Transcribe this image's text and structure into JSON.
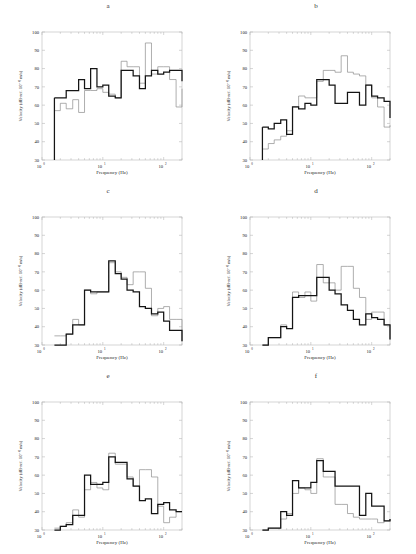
{
  "figure": {
    "panel_count": 6,
    "rows": 3,
    "cols": 2
  },
  "axes": {
    "ylabel": "Velocity (dB-ref. 10⁻⁹ m/s)",
    "xlabel": "Frequency (Hz)",
    "ylim": [
      30,
      100
    ],
    "yticks": [
      30,
      40,
      50,
      60,
      70,
      80,
      90,
      100
    ],
    "xlim": [
      1,
      200
    ],
    "xtick_labels": [
      "10",
      "10",
      "10"
    ],
    "xtick_exponents": [
      "0",
      "1",
      "2"
    ],
    "xtick_values": [
      1,
      10,
      100
    ],
    "xscale": "log",
    "grid": false,
    "frame_color": "#b9b9b9"
  },
  "series_style": {
    "series1_name": "thick-black-trace",
    "series1_color": "#141414",
    "series1_width": 1.25,
    "series2_name": "thin-gray-trace",
    "series2_color": "#8c8c8c",
    "series2_width": 0.7,
    "step_type": "post"
  },
  "chart_data": [
    {
      "type": "line",
      "panel": "a",
      "title": "a",
      "xlabel": "Frequency (Hz)",
      "ylabel": "Velocity (dB-ref. 10⁻⁹ m/s)",
      "xscale": "log",
      "xlim": [
        1,
        200
      ],
      "ylim": [
        30,
        100
      ],
      "x": [
        1.6,
        2.0,
        2.5,
        3.2,
        4.0,
        5.0,
        6.3,
        8.0,
        10.0,
        12.5,
        16.0,
        20.0,
        25.0,
        31.5,
        40.0,
        50.0,
        63.0,
        80.0,
        100.0,
        125.0,
        160.0,
        200.0
      ],
      "series": [
        {
          "name": "thick-black-trace",
          "values": [
            64,
            64,
            68,
            68,
            74,
            69,
            80,
            70,
            71,
            65,
            64,
            79,
            79,
            76,
            69,
            76,
            79,
            77,
            78,
            79,
            79,
            73
          ]
        },
        {
          "name": "thin-gray-trace",
          "values": [
            57,
            61,
            58,
            63,
            56,
            68,
            68,
            69,
            67,
            66,
            64,
            84,
            81,
            81,
            72,
            94,
            77,
            81,
            81,
            74,
            59,
            69
          ]
        }
      ]
    },
    {
      "type": "line",
      "panel": "b",
      "title": "b",
      "xlabel": "Frequency (Hz)",
      "ylabel": "Velocity (dB-ref. 10⁻⁹ m/s)",
      "xscale": "log",
      "xlim": [
        1,
        200
      ],
      "ylim": [
        30,
        100
      ],
      "x": [
        1.6,
        2.0,
        2.5,
        3.2,
        4.0,
        5.0,
        6.3,
        8.0,
        10.0,
        12.5,
        16.0,
        20.0,
        25.0,
        31.5,
        40.0,
        50.0,
        63.0,
        80.0,
        100.0,
        125.0,
        160.0,
        200.0
      ],
      "series": [
        {
          "name": "thick-black-trace",
          "values": [
            48,
            47,
            50,
            52,
            44,
            59,
            58,
            61,
            60,
            74,
            74,
            71,
            61,
            61,
            67,
            67,
            60,
            71,
            65,
            64,
            62,
            53
          ]
        },
        {
          "name": "thin-gray-trace",
          "values": [
            36,
            39,
            41,
            43,
            46,
            59,
            65,
            64,
            64,
            73,
            79,
            79,
            78,
            87,
            78,
            77,
            76,
            71,
            64,
            59,
            48,
            49
          ]
        }
      ]
    },
    {
      "type": "line",
      "panel": "c",
      "title": "c",
      "xlabel": "Frequency (Hz)",
      "ylabel": "Velocity (dB-ref. 10⁻⁹ m/s)",
      "xscale": "log",
      "xlim": [
        1,
        200
      ],
      "ylim": [
        30,
        100
      ],
      "x": [
        1.6,
        2.0,
        2.5,
        3.2,
        4.0,
        5.0,
        6.3,
        8.0,
        10.0,
        12.5,
        16.0,
        20.0,
        25.0,
        31.5,
        40.0,
        50.0,
        63.0,
        80.0,
        100.0,
        125.0,
        160.0,
        200.0
      ],
      "series": [
        {
          "name": "thick-black-trace",
          "values": [
            30,
            30,
            36,
            41,
            41,
            60,
            59,
            59,
            59,
            76,
            69,
            66,
            60,
            59,
            51,
            50,
            47,
            48,
            43,
            38,
            38,
            32
          ]
        },
        {
          "name": "thin-gray-trace",
          "values": [
            35,
            35,
            36,
            44,
            41,
            60,
            58,
            59,
            59,
            75,
            70,
            67,
            63,
            70,
            70,
            61,
            46,
            50,
            51,
            44,
            44,
            32
          ]
        }
      ]
    },
    {
      "type": "line",
      "panel": "d",
      "title": "d",
      "xlabel": "Frequency (Hz)",
      "ylabel": "Velocity (dB-ref. 10⁻⁹ m/s)",
      "xscale": "log",
      "xlim": [
        1,
        200
      ],
      "ylim": [
        30,
        100
      ],
      "x": [
        1.6,
        2.0,
        2.5,
        3.2,
        4.0,
        5.0,
        6.3,
        8.0,
        10.0,
        12.5,
        16.0,
        20.0,
        25.0,
        31.5,
        40.0,
        50.0,
        63.0,
        80.0,
        100.0,
        125.0,
        160.0,
        200.0
      ],
      "series": [
        {
          "name": "thick-black-trace",
          "values": [
            30,
            34,
            34,
            40,
            39,
            56,
            57,
            57,
            57,
            67,
            67,
            60,
            58,
            52,
            49,
            44,
            41,
            47,
            45,
            44,
            41,
            33
          ]
        },
        {
          "name": "thin-gray-trace",
          "values": [
            30,
            34,
            34,
            41,
            39,
            59,
            56,
            59,
            54,
            74,
            64,
            64,
            60,
            73,
            73,
            61,
            56,
            44,
            48,
            48,
            41,
            33
          ]
        }
      ]
    },
    {
      "type": "line",
      "panel": "e",
      "title": "e",
      "xlabel": "Frequency (Hz)",
      "ylabel": "Velocity (dB-ref. 10⁻⁹ m/s)",
      "xscale": "log",
      "xlim": [
        1,
        200
      ],
      "ylim": [
        30,
        100
      ],
      "x": [
        1.6,
        2.0,
        2.5,
        3.2,
        4.0,
        5.0,
        6.3,
        8.0,
        10.0,
        12.5,
        16.0,
        20.0,
        25.0,
        31.5,
        40.0,
        50.0,
        63.0,
        80.0,
        100.0,
        125.0,
        160.0,
        200.0
      ],
      "series": [
        {
          "name": "thick-black-trace",
          "values": [
            30,
            32,
            33,
            38,
            38,
            60,
            55,
            55,
            56,
            70,
            67,
            67,
            58,
            54,
            46,
            47,
            39,
            44,
            45,
            41,
            40,
            40
          ]
        },
        {
          "name": "thin-gray-trace",
          "values": [
            31,
            32,
            34,
            41,
            37,
            52,
            56,
            53,
            52,
            72,
            66,
            66,
            59,
            54,
            63,
            63,
            59,
            43,
            34,
            37,
            40,
            40
          ]
        }
      ]
    },
    {
      "type": "line",
      "panel": "f",
      "title": "f",
      "xlabel": "Frequency (Hz)",
      "ylabel": "Velocity (dB-ref. 10⁻⁹ m/s)",
      "xscale": "log",
      "xlim": [
        1,
        200
      ],
      "ylim": [
        30,
        100
      ],
      "x": [
        1.6,
        2.0,
        2.5,
        3.2,
        4.0,
        5.0,
        6.3,
        8.0,
        10.0,
        12.5,
        16.0,
        20.0,
        25.0,
        31.5,
        40.0,
        50.0,
        63.0,
        80.0,
        100.0,
        125.0,
        160.0,
        200.0
      ],
      "series": [
        {
          "name": "thick-black-trace",
          "values": [
            30,
            31,
            31,
            40,
            38,
            57,
            53,
            53,
            56,
            68,
            62,
            62,
            54,
            54,
            54,
            54,
            38,
            50,
            43,
            43,
            35,
            36
          ]
        },
        {
          "name": "thin-gray-trace",
          "values": [
            30,
            31,
            31,
            36,
            39,
            50,
            53,
            52,
            50,
            69,
            59,
            59,
            44,
            44,
            39,
            37,
            36,
            36,
            36,
            34,
            35,
            36
          ]
        }
      ]
    }
  ]
}
